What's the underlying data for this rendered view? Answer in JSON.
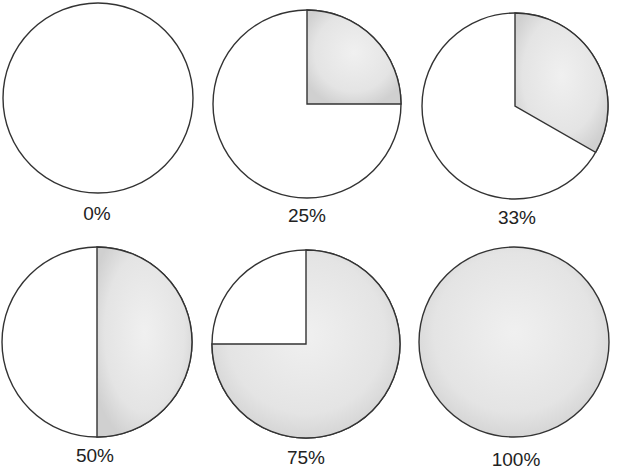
{
  "chart_data": {
    "type": "pie",
    "title": "",
    "grid": false,
    "charts": [
      {
        "label": "0%",
        "value": 0,
        "cx": 98,
        "cy": 98,
        "r": 95,
        "label_x": 97,
        "label_y": 203
      },
      {
        "label": "25%",
        "value": 25,
        "cx": 307,
        "cy": 104,
        "r": 94,
        "label_x": 307,
        "label_y": 205
      },
      {
        "label": "33%",
        "value": 33.3,
        "cx": 515,
        "cy": 106,
        "r": 93,
        "label_x": 517,
        "label_y": 207
      },
      {
        "label": "50%",
        "value": 50,
        "cx": 97,
        "cy": 342,
        "r": 95,
        "label_x": 95,
        "label_y": 445
      },
      {
        "label": "75%",
        "value": 75,
        "cx": 306,
        "cy": 344,
        "r": 94,
        "label_x": 306,
        "label_y": 447
      },
      {
        "label": "100%",
        "value": 100,
        "cx": 514,
        "cy": 342,
        "r": 95,
        "label_x": 516,
        "label_y": 449
      }
    ],
    "colors": {
      "filled": "#e6e6e6",
      "filled_edge": "#d2d2d2",
      "empty": "#ffffff",
      "stroke": "#333333"
    }
  }
}
